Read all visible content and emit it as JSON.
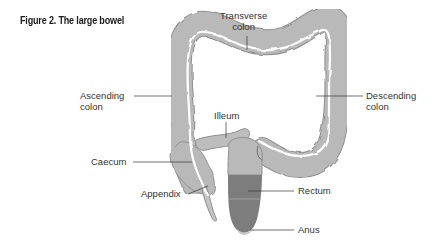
{
  "figure": {
    "title": "Figure 2. The large bowel"
  },
  "labels": {
    "transverse_colon": {
      "line1": "Transverse",
      "line2": "colon"
    },
    "ascending_colon": {
      "line1": "Ascending",
      "line2": "colon"
    },
    "descending_colon": {
      "line1": "Descending",
      "line2": "colon"
    },
    "ileum": "Illeum",
    "caecum": "Caecum",
    "appendix": "Appendix",
    "rectum": "Rectum",
    "anus": "Anus"
  },
  "colors": {
    "bowel_fill": "#b9b9b9",
    "bowel_outline": "#8f8f8f",
    "lumen": "#ffffff",
    "rectum_dark": "#7d7d7d",
    "anus": "#c8c8c8",
    "leader_line": "#333333",
    "text": "#333333"
  }
}
